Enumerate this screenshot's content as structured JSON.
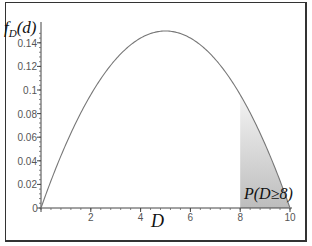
{
  "chart_data": {
    "type": "area",
    "title": "",
    "ylabel": "f_D(d)",
    "xlabel": "D",
    "xlim": [
      0,
      10
    ],
    "ylim": [
      0,
      0.15
    ],
    "xticks": [
      0,
      2,
      4,
      6,
      8,
      10
    ],
    "xtick_labels": [
      "0",
      "2",
      "4",
      "6",
      "8",
      "10"
    ],
    "yticks": [
      0,
      0.02,
      0.04,
      0.06,
      0.08,
      0.1,
      0.12,
      0.14
    ],
    "ytick_labels": [
      "0",
      "0.02",
      "0.04",
      "0.06",
      "0.08",
      "0.1",
      "0.12",
      "0.14"
    ],
    "grid": false,
    "series": [
      {
        "name": "f_D(d) = 0.006·d·(10−d)",
        "x": [
          0,
          1,
          2,
          3,
          4,
          5,
          6,
          7,
          8,
          9,
          10
        ],
        "values": [
          0,
          0.054,
          0.096,
          0.126,
          0.144,
          0.15,
          0.144,
          0.126,
          0.096,
          0.054,
          0
        ]
      }
    ],
    "shaded_region": {
      "from": 8,
      "to": 10,
      "label": "P(D≥8)"
    },
    "annotations": [
      "P(D≥8)"
    ]
  },
  "labels": {
    "y_f": "f",
    "y_sub": "D",
    "y_arg": "(d)",
    "x_axis": "D",
    "shade_label": "P(D≥8)"
  }
}
